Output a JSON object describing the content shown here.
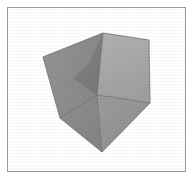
{
  "figure": {
    "background_color": "#ffffff",
    "frame": {
      "border_color": "#9a9aa0",
      "border_width": 1,
      "x": 7,
      "y": 7,
      "width": 179,
      "height": 165,
      "fill": "#ffffff"
    },
    "object": {
      "shape_name": "cube",
      "vertices": {
        "left": [
          43,
          57
        ],
        "top": [
          103,
          33
        ],
        "top_right": [
          149,
          40
        ],
        "center": [
          97,
          95
        ],
        "bottom": [
          102,
          152
        ],
        "right": [
          150,
          103
        ],
        "lower_left": [
          60,
          118
        ],
        "inner_upper": [
          90,
          62
        ],
        "inner_left": [
          73,
          78
        ],
        "inner_lower": [
          100,
          93
        ]
      },
      "faces": [
        {
          "name": "top-face",
          "fill": "#a9a9a9"
        },
        {
          "name": "left-face",
          "fill": "#8e8e8e"
        },
        {
          "name": "right-face",
          "fill": "#969696"
        },
        {
          "name": "inner-shadow-face",
          "fill": "#7c7c7c"
        },
        {
          "name": "lower-left-face",
          "fill": "#8a8a8a"
        }
      ],
      "edge_color": "#6f6f6f",
      "edge_width": 0.6
    }
  }
}
